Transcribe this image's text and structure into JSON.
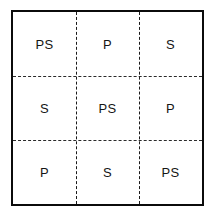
{
  "figure": {
    "name": "three-by-three-labeled-grid",
    "frame": {
      "border_color": "#0b0b0b",
      "background_color": "#ffffff"
    },
    "divider": {
      "style": "dashed",
      "color": "#1a1a1a"
    },
    "grid": {
      "rows": 3,
      "columns": 3,
      "cells": [
        {
          "row": 1,
          "col": 1,
          "label": "PS"
        },
        {
          "row": 1,
          "col": 2,
          "label": "P"
        },
        {
          "row": 1,
          "col": 3,
          "label": "S"
        },
        {
          "row": 2,
          "col": 1,
          "label": "S"
        },
        {
          "row": 2,
          "col": 2,
          "label": "PS"
        },
        {
          "row": 2,
          "col": 3,
          "label": "P"
        },
        {
          "row": 3,
          "col": 1,
          "label": "P"
        },
        {
          "row": 3,
          "col": 2,
          "label": "S"
        },
        {
          "row": 3,
          "col": 3,
          "label": "PS"
        }
      ]
    }
  }
}
